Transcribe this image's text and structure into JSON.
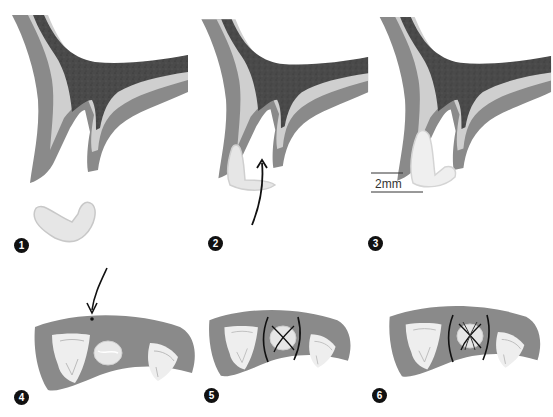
{
  "figure": {
    "colors": {
      "outer_gingiva": "#8a8a8a",
      "inner_layer": "#cfcfcf",
      "bone_core": "#4a4a4a",
      "graft": "#e4e4e4",
      "tooth": "#eeeeee",
      "arrow": "#111111",
      "suture": "#111111"
    },
    "steps": [
      {
        "number": "1",
        "label": "graft prepared (V-shaped)"
      },
      {
        "number": "2",
        "label": "graft inserted, curved arrow shows rotation"
      },
      {
        "number": "3",
        "label": "graft in place"
      },
      {
        "number": "4",
        "label": "occlusal view, arrow marks incision point"
      },
      {
        "number": "5",
        "label": "occlusal view with cross suture"
      },
      {
        "number": "6",
        "label": "occlusal view with double cross suture"
      }
    ],
    "scale": {
      "label": "2mm"
    }
  }
}
